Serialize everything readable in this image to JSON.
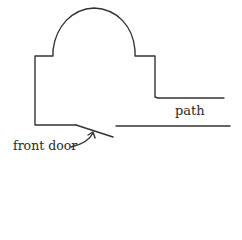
{
  "diagram": {
    "type": "floor-plan-sketch",
    "labels": {
      "path": "path",
      "front_door": "front door"
    },
    "stroke_color": "#333333",
    "background": "#ffffff"
  }
}
